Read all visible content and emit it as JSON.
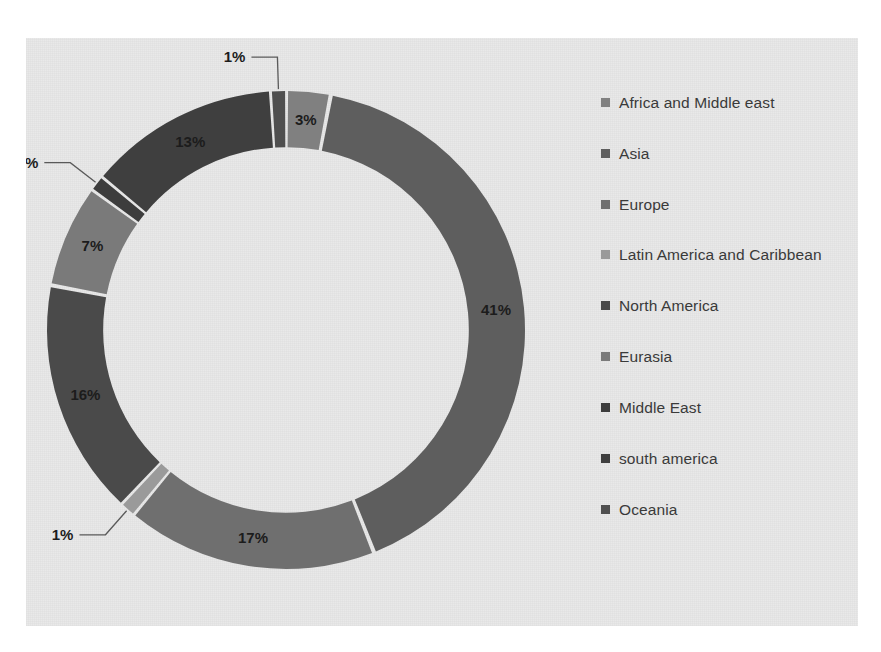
{
  "chart_data": {
    "type": "pie",
    "variant": "doughnut",
    "title": "",
    "xlabel": "",
    "ylabel": "",
    "grid": false,
    "legend_position": "right",
    "start_angle_deg": 0,
    "direction": "clockwise",
    "inner_radius_ratio": 0.765,
    "categories": [
      "Africa and Middle east",
      "Asia",
      "Europe",
      "Latin America and Caribbean",
      "North America",
      "Eurasia",
      "Middle East",
      "south america",
      "Oceania"
    ],
    "values": [
      3,
      41,
      17,
      1,
      16,
      7,
      1,
      13,
      1
    ],
    "data_labels": [
      "3%",
      "41%",
      "17%",
      "1%",
      "16%",
      "7%",
      "1%",
      "13%",
      "1%"
    ],
    "colors": [
      "#808080",
      "#5e5e5e",
      "#6f6f6f",
      "#9a9a9a",
      "#4a4a4a",
      "#7a7a7a",
      "#3d3d3d",
      "#3f3f3f",
      "#4f4f4f"
    ],
    "label_placement": [
      "inside",
      "inside",
      "inside",
      "outside-callout",
      "inside",
      "inside",
      "outside-callout",
      "inside",
      "outside-callout"
    ]
  },
  "legend": {
    "items": [
      {
        "label": "Africa and Middle east",
        "color": "#808080"
      },
      {
        "label": "Asia",
        "color": "#5e5e5e"
      },
      {
        "label": "Europe",
        "color": "#6f6f6f"
      },
      {
        "label": "Latin America and Caribbean",
        "color": "#9a9a9a"
      },
      {
        "label": "North America",
        "color": "#4a4a4a"
      },
      {
        "label": "Eurasia",
        "color": "#7a7a7a"
      },
      {
        "label": "Middle East",
        "color": "#3d3d3d"
      },
      {
        "label": "south america",
        "color": "#3f3f3f"
      },
      {
        "label": "Oceania",
        "color": "#4f4f4f"
      }
    ]
  },
  "plot_area": {
    "background_color": "#e9e9e9",
    "page_background_color": "#ffffff"
  }
}
